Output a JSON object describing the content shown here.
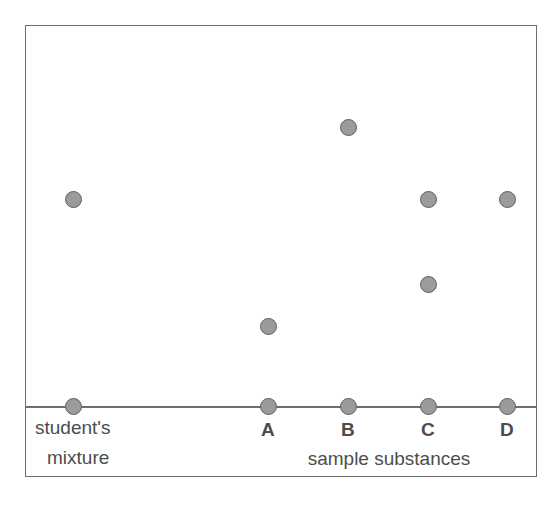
{
  "figure": {
    "frame": {
      "x": 25,
      "y": 25,
      "width": 512,
      "height": 452
    },
    "baseline_y": 406,
    "colors": {
      "spot_fill": "#9b9b9b",
      "spot_stroke": "#5f5f5f",
      "frame_stroke": "#6e6e6e",
      "text": "#4d4d4d",
      "background": "#ffffff"
    },
    "labels": {
      "mixture_line1": "student's",
      "mixture_line2": "mixture",
      "samples_caption": "sample substances"
    }
  },
  "chart_data": {
    "type": "scatter",
    "xlabel": "sample substances",
    "ylabel": "",
    "grid": false,
    "legend": "none",
    "x_categories": [
      "student's mixture",
      "A",
      "B",
      "C",
      "D"
    ],
    "lane_x_px": [
      73,
      268,
      348,
      428,
      507
    ],
    "baseline_y_px": 406,
    "spot_diameter_px": 17,
    "series": [
      {
        "name": "student's mixture",
        "lane_label": "student's mixture",
        "lane_x": 73,
        "spots": [
          {
            "y": 406,
            "kind": "origin"
          },
          {
            "y": 199,
            "kind": "component"
          }
        ]
      },
      {
        "name": "A",
        "lane_label": "A",
        "lane_x": 268,
        "spots": [
          {
            "y": 406,
            "kind": "origin"
          },
          {
            "y": 326,
            "kind": "component"
          }
        ]
      },
      {
        "name": "B",
        "lane_label": "B",
        "lane_x": 348,
        "spots": [
          {
            "y": 406,
            "kind": "origin"
          },
          {
            "y": 127,
            "kind": "component"
          }
        ]
      },
      {
        "name": "C",
        "lane_label": "C",
        "lane_x": 428,
        "spots": [
          {
            "y": 406,
            "kind": "origin"
          },
          {
            "y": 284,
            "kind": "component"
          },
          {
            "y": 199,
            "kind": "component"
          }
        ]
      },
      {
        "name": "D",
        "lane_label": "D",
        "lane_x": 507,
        "spots": [
          {
            "y": 406,
            "kind": "origin"
          },
          {
            "y": 199,
            "kind": "component"
          }
        ]
      }
    ]
  }
}
